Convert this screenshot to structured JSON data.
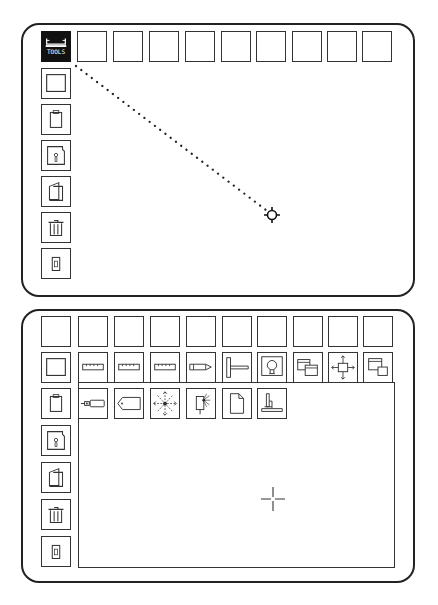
{
  "top_screen": {
    "top_bar": {
      "items": [
        {
          "icon": "tools-icon",
          "label": "TOOLS",
          "selected": true
        },
        {
          "icon": "empty-slot"
        },
        {
          "icon": "empty-slot"
        },
        {
          "icon": "empty-slot"
        },
        {
          "icon": "empty-slot"
        },
        {
          "icon": "empty-slot"
        },
        {
          "icon": "empty-slot"
        },
        {
          "icon": "empty-slot"
        },
        {
          "icon": "empty-slot"
        },
        {
          "icon": "empty-slot"
        }
      ]
    },
    "sidebar": {
      "items": [
        {
          "icon": "window-icon"
        },
        {
          "icon": "clipboard-icon"
        },
        {
          "icon": "floppy-disk-icon"
        },
        {
          "icon": "folder-icon"
        },
        {
          "icon": "trash-icon"
        },
        {
          "icon": "door-icon"
        }
      ]
    },
    "drag_path": {
      "from": [
        76,
        66
      ],
      "to": [
        268,
        211
      ],
      "style": "dotted"
    },
    "cursor": {
      "type": "target-cursor",
      "x": 272,
      "y": 215
    }
  },
  "bottom_screen": {
    "top_bar": {
      "items": [
        {
          "icon": "empty-slot"
        },
        {
          "icon": "empty-slot"
        },
        {
          "icon": "empty-slot"
        },
        {
          "icon": "empty-slot"
        },
        {
          "icon": "empty-slot"
        },
        {
          "icon": "empty-slot"
        },
        {
          "icon": "empty-slot"
        },
        {
          "icon": "empty-slot"
        },
        {
          "icon": "empty-slot"
        },
        {
          "icon": "empty-slot"
        }
      ]
    },
    "sidebar": {
      "items": [
        {
          "icon": "window-icon"
        },
        {
          "icon": "clipboard-icon"
        },
        {
          "icon": "floppy-disk-icon"
        },
        {
          "icon": "folder-icon"
        },
        {
          "icon": "trash-icon"
        },
        {
          "icon": "door-icon"
        }
      ]
    },
    "tools_row_1": [
      {
        "icon": "ruler-icon"
      },
      {
        "icon": "ruler-icon"
      },
      {
        "icon": "ruler-icon"
      },
      {
        "icon": "pencil-icon"
      },
      {
        "icon": "t-square-icon"
      },
      {
        "icon": "lamp-icon"
      },
      {
        "icon": "overlap-windows-icon"
      },
      {
        "icon": "move-resize-icon"
      },
      {
        "icon": "stacked-windows-icon"
      }
    ],
    "tools_row_2": [
      {
        "icon": "plug-icon"
      },
      {
        "icon": "tag-icon"
      },
      {
        "icon": "expand-arrows-icon"
      },
      {
        "icon": "light-switch-icon"
      },
      {
        "icon": "document-icon"
      },
      {
        "icon": "stand-icon"
      }
    ],
    "cursor": {
      "type": "crosshair-cursor",
      "x": 273,
      "y": 499
    }
  }
}
